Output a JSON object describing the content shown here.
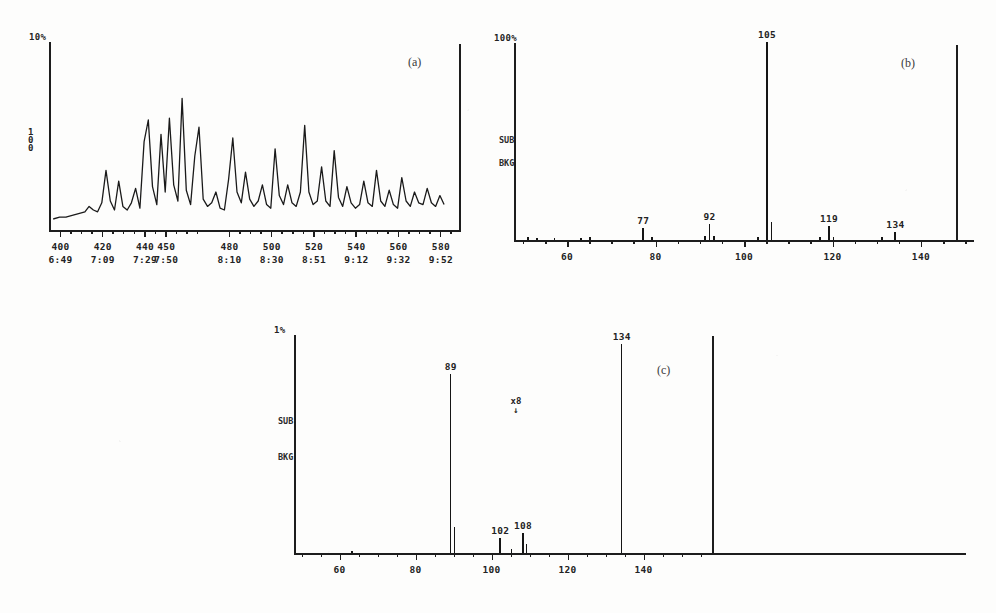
{
  "document": {
    "kind": "scanned-figure-page",
    "panel_count": 3
  },
  "panels": {
    "a": {
      "tag": "(a)",
      "type": "chromatogram",
      "y_top_label": "10%",
      "y_side_label": "100",
      "x_tick_scans": [
        "400",
        "420",
        "440",
        "450",
        "480",
        "500",
        "520",
        "540",
        "560",
        "580"
      ],
      "x_tick_times": [
        "6:49",
        "7:09",
        "7:29",
        "7:50",
        "8:10",
        "8:30",
        "8:51",
        "9:12",
        "9:32",
        "9:52"
      ]
    },
    "b": {
      "tag": "(b)",
      "type": "mass-spectrum",
      "y_top_label": "100%",
      "side_label_1": "SUB",
      "side_label_2": "BKG",
      "x_ticks": [
        "60",
        "80",
        "100",
        "120",
        "140"
      ],
      "peak_labels": [
        "77",
        "92",
        "105",
        "119",
        "134"
      ]
    },
    "c": {
      "tag": "(c)",
      "type": "mass-spectrum",
      "y_top_label": "1%",
      "side_label_1": "SUB",
      "side_label_2": "BKG",
      "scale_note": "x8",
      "x_ticks": [
        "60",
        "80",
        "100",
        "120",
        "140"
      ],
      "peak_labels": [
        "89",
        "102",
        "108",
        "134"
      ]
    }
  },
  "chart_data": [
    {
      "id": "a",
      "type": "line",
      "title": "(a)",
      "xlabel": "",
      "ylabel": "100",
      "xlim": [
        395,
        590
      ],
      "ylim": [
        0,
        10
      ],
      "grid": false,
      "legend": "none",
      "xtick_values": [
        400,
        420,
        440,
        450,
        480,
        500,
        520,
        540,
        560,
        580
      ],
      "xtick_labels": [
        "400",
        "420",
        "440",
        "450",
        "480",
        "500",
        "520",
        "540",
        "560",
        "580"
      ],
      "xtick_labels_secondary": [
        "6:49",
        "7:09",
        "7:29",
        "7:50",
        "8:10",
        "8:30",
        "8:51",
        "9:12",
        "9:32",
        "9:52"
      ],
      "annotations": [
        "10%",
        "100",
        "(a)"
      ],
      "x": [
        397,
        400,
        403,
        406,
        409,
        412,
        414,
        416,
        418,
        420,
        422,
        424,
        426,
        428,
        430,
        432,
        434,
        436,
        438,
        440,
        442,
        444,
        446,
        448,
        450,
        452,
        454,
        456,
        458,
        460,
        462,
        464,
        466,
        468,
        470,
        472,
        474,
        476,
        478,
        480,
        482,
        484,
        486,
        488,
        490,
        492,
        494,
        496,
        498,
        500,
        502,
        504,
        506,
        508,
        510,
        512,
        514,
        516,
        518,
        520,
        522,
        524,
        526,
        528,
        530,
        532,
        534,
        536,
        538,
        540,
        542,
        544,
        546,
        548,
        550,
        552,
        554,
        556,
        558,
        560,
        562,
        564,
        566,
        568,
        570,
        572,
        574,
        576,
        578,
        580,
        582
      ],
      "y": [
        0.5,
        0.6,
        0.6,
        0.7,
        0.8,
        0.9,
        1.2,
        1.0,
        0.9,
        1.4,
        3.2,
        1.5,
        1.0,
        2.6,
        1.2,
        1.0,
        1.4,
        2.2,
        1.1,
        4.8,
        6.0,
        2.3,
        1.3,
        5.2,
        2.0,
        6.1,
        2.4,
        1.5,
        7.2,
        2.1,
        1.3,
        4.0,
        5.6,
        1.6,
        1.2,
        1.4,
        2.0,
        1.1,
        1.0,
        2.7,
        5.0,
        2.0,
        1.4,
        3.1,
        1.6,
        1.2,
        1.5,
        2.4,
        1.3,
        1.1,
        4.4,
        1.8,
        1.3,
        2.4,
        1.4,
        1.2,
        2.0,
        5.7,
        2.0,
        1.3,
        1.5,
        3.4,
        1.5,
        1.2,
        4.3,
        1.7,
        1.2,
        2.3,
        1.4,
        1.1,
        1.3,
        2.6,
        1.4,
        1.2,
        3.2,
        1.5,
        1.2,
        2.1,
        1.3,
        1.1,
        2.8,
        1.5,
        1.2,
        2.0,
        1.4,
        1.3,
        2.2,
        1.4,
        1.2,
        1.8,
        1.3
      ]
    },
    {
      "id": "b",
      "type": "bar",
      "title": "(b)",
      "xlabel": "m/z",
      "ylabel": "100%",
      "xlim": [
        48,
        152
      ],
      "ylim": [
        0,
        100
      ],
      "grid": false,
      "legend": "none",
      "xtick_values": [
        60,
        80,
        100,
        120,
        140
      ],
      "xtick_labels": [
        "60",
        "80",
        "100",
        "120",
        "140"
      ],
      "annotations": [
        "100%",
        "SUB",
        "BKG",
        "(b)"
      ],
      "mz": [
        51,
        53,
        57,
        63,
        65,
        77,
        79,
        91,
        92,
        93,
        103,
        105,
        106,
        117,
        119,
        120,
        131,
        134
      ],
      "intensity": [
        1.5,
        1.2,
        1.0,
        1.2,
        1.5,
        6.0,
        1.5,
        2.0,
        8.0,
        2.0,
        1.5,
        100,
        9.0,
        1.5,
        7.0,
        1.5,
        1.5,
        4.0
      ],
      "labeled_peaks": [
        {
          "mz": 77,
          "label": "77"
        },
        {
          "mz": 92,
          "label": "92"
        },
        {
          "mz": 105,
          "label": "105"
        },
        {
          "mz": 119,
          "label": "119"
        },
        {
          "mz": 134,
          "label": "134"
        }
      ]
    },
    {
      "id": "c",
      "type": "bar",
      "title": "(c)",
      "xlabel": "m/z",
      "ylabel": "1%",
      "xlim": [
        48,
        158
      ],
      "ylim": [
        0,
        100
      ],
      "grid": false,
      "legend": "none",
      "xtick_values": [
        60,
        80,
        100,
        120,
        140
      ],
      "xtick_labels": [
        "60",
        "80",
        "100",
        "120",
        "140"
      ],
      "annotations": [
        "1%",
        "SUB",
        "BKG",
        "x8",
        "(c)"
      ],
      "mz": [
        63,
        89,
        90,
        102,
        105,
        108,
        109,
        134
      ],
      "intensity": [
        1.0,
        82,
        12,
        7.0,
        2.0,
        9.0,
        4.0,
        96
      ],
      "labeled_peaks": [
        {
          "mz": 89,
          "label": "89"
        },
        {
          "mz": 102,
          "label": "102"
        },
        {
          "mz": 108,
          "label": "108"
        },
        {
          "mz": 134,
          "label": "134"
        }
      ]
    }
  ]
}
